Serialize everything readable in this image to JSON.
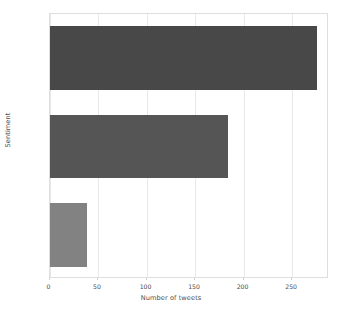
{
  "chart_data": {
    "type": "bar",
    "orientation": "horizontal",
    "title": "",
    "categories": [
      "neutral",
      "positive",
      "negative"
    ],
    "values": [
      276,
      184,
      39
    ],
    "xlabel": "Number of tweets",
    "ylabel": "Sentiment",
    "xlim": [
      0,
      288
    ],
    "ylim": [
      0,
      3
    ],
    "xticks": [
      0,
      50,
      100,
      150,
      200,
      250
    ],
    "xtick_labels": [
      "0",
      "50",
      "100",
      "150",
      "200",
      "250"
    ],
    "ytick_labels": [
      "neutral",
      "positive",
      "negative"
    ],
    "grid": "vertical",
    "legend": "none",
    "bar_colors": [
      "#484848",
      "#555555",
      "#828282"
    ],
    "background_color": "#ffffff",
    "axis_color": "#dedede",
    "gridline_color": "#e8e8e8",
    "tick_label_color": "#4d4d4d"
  }
}
